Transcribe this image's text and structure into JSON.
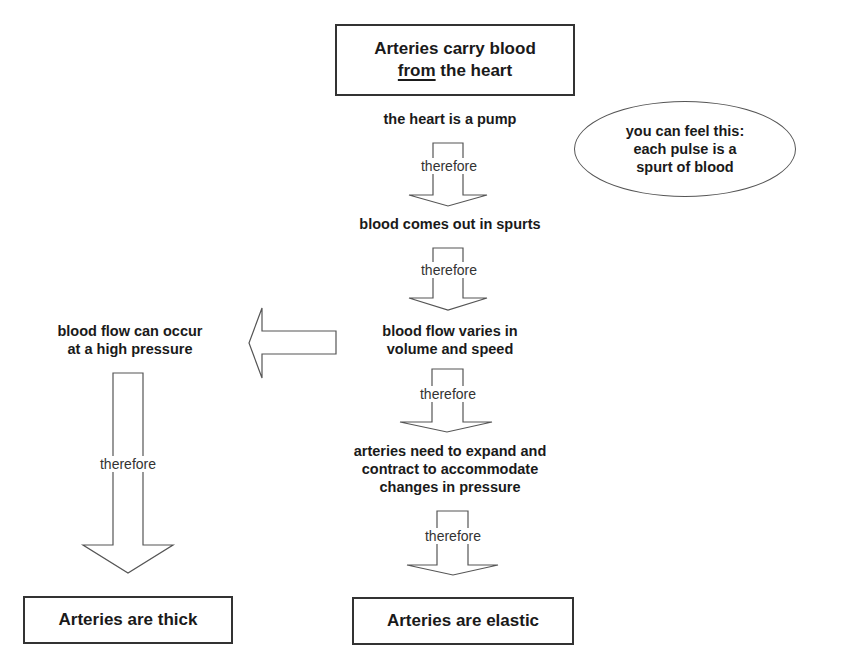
{
  "diagram": {
    "title_box": {
      "line1": "Arteries carry blood",
      "line2_underlined": "from",
      "line2_rest": " the heart"
    },
    "nodes": {
      "heart_pump": "the heart is a pump",
      "spurts": "blood comes out in spurts",
      "varies_line1": "blood flow varies in",
      "varies_line2": "volume and speed",
      "expand_line1": "arteries need to expand and",
      "expand_line2": "contract to accommodate",
      "expand_line3": "changes in pressure",
      "high_pressure_line1": "blood flow can occur",
      "high_pressure_line2": "at a high pressure"
    },
    "callout": {
      "line1": "you can feel this:",
      "line2": "each pulse is a",
      "line3": "spurt of blood"
    },
    "connector_label": "therefore",
    "conclusions": {
      "thick": "Arteries are thick",
      "elastic": "Arteries are elastic"
    }
  }
}
